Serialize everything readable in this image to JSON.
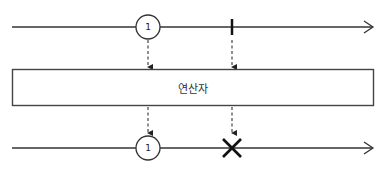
{
  "diagram": {
    "type": "marble-diagram",
    "input_timeline": {
      "items": [
        {
          "kind": "value",
          "label": "1"
        },
        {
          "kind": "completion"
        }
      ]
    },
    "operator": {
      "label": "연산자"
    },
    "output_timeline": {
      "items": [
        {
          "kind": "value",
          "label": "1"
        },
        {
          "kind": "error"
        }
      ]
    },
    "colors": {
      "line": "#333333",
      "box_border": "#444444",
      "marker": "#111111",
      "background": "#ffffff"
    }
  }
}
